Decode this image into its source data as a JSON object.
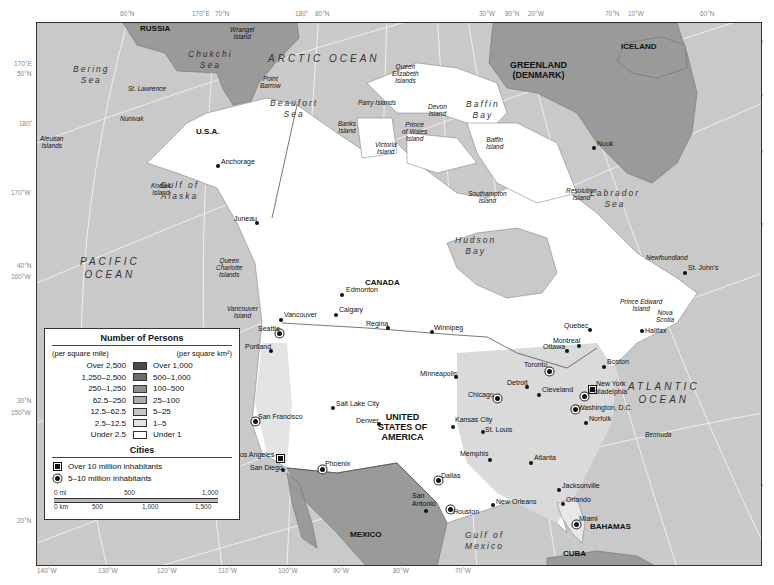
{
  "map": {
    "title": "Number of Persons",
    "frame_colors": {
      "ocean": "#c9c9c9",
      "land_foreign": "#9a9a9a",
      "land_sparse": "#ffffff",
      "land_dense": "#dadada",
      "graticule": "#f2f2f2",
      "border": "#333333"
    },
    "edge_labels": {
      "top": [
        {
          "text": "60°N",
          "x": 120,
          "y": 14
        },
        {
          "text": "170°E",
          "x": 192,
          "y": 14
        },
        {
          "text": "70°N",
          "x": 215,
          "y": 14
        },
        {
          "text": "180°",
          "x": 295,
          "y": 14
        },
        {
          "text": "80°N",
          "x": 315,
          "y": 14
        },
        {
          "text": "30°W",
          "x": 479,
          "y": 14
        },
        {
          "text": "80°N",
          "x": 505,
          "y": 14
        },
        {
          "text": "20°W",
          "x": 528,
          "y": 14
        },
        {
          "text": "70°N",
          "x": 605,
          "y": 14
        },
        {
          "text": "10°W",
          "x": 628,
          "y": 14
        },
        {
          "text": "60°N",
          "x": 700,
          "y": 14
        }
      ],
      "left": [
        {
          "text": "170°E",
          "x": 14,
          "y": 64
        },
        {
          "text": "50°N",
          "x": 17,
          "y": 74
        },
        {
          "text": "180°",
          "x": 19,
          "y": 124
        },
        {
          "text": "170°W",
          "x": 11,
          "y": 193
        },
        {
          "text": "40°N",
          "x": 17,
          "y": 266
        },
        {
          "text": "160°W",
          "x": 11,
          "y": 277
        },
        {
          "text": "30°N",
          "x": 17,
          "y": 401
        },
        {
          "text": "150°W",
          "x": 11,
          "y": 413
        },
        {
          "text": "20°N",
          "x": 17,
          "y": 521
        }
      ],
      "right": [
        {
          "text": "10°W",
          "x": 747,
          "y": 43
        },
        {
          "text": "20°W",
          "x": 747,
          "y": 97
        },
        {
          "text": "30°W",
          "x": 747,
          "y": 153
        },
        {
          "text": "50°N",
          "x": 747,
          "y": 189
        },
        {
          "text": "40°W",
          "x": 747,
          "y": 226
        },
        {
          "text": "40°N",
          "x": 747,
          "y": 317
        },
        {
          "text": "30°N",
          "x": 747,
          "y": 427
        },
        {
          "text": "60°W",
          "x": 747,
          "y": 487
        },
        {
          "text": "20°N",
          "x": 747,
          "y": 527
        }
      ],
      "bottom": [
        {
          "text": "140°W",
          "x": 37,
          "y": 571
        },
        {
          "text": "130°W",
          "x": 98,
          "y": 571
        },
        {
          "text": "120°W",
          "x": 157,
          "y": 571
        },
        {
          "text": "110°W",
          "x": 218,
          "y": 571
        },
        {
          "text": "100°W",
          "x": 278,
          "y": 571
        },
        {
          "text": "90°W",
          "x": 333,
          "y": 571
        },
        {
          "text": "80°W",
          "x": 393,
          "y": 571
        },
        {
          "text": "70°W",
          "x": 455,
          "y": 571
        }
      ]
    },
    "countries": [
      {
        "text": "RUSSIA",
        "x": 160,
        "y": 30,
        "cls": "country"
      },
      {
        "text": "U.S.A.",
        "x": 216,
        "y": 133,
        "cls": "country"
      },
      {
        "text": "CANADA",
        "x": 385,
        "y": 284,
        "cls": "country"
      },
      {
        "text": "UNITED\nSTATES OF\nAMERICA",
        "x": 398,
        "y": 417,
        "cls": "country-big"
      },
      {
        "text": "MEXICO",
        "x": 370,
        "y": 536,
        "cls": "country"
      },
      {
        "text": "GREENLAND\n(DENMARK)",
        "x": 530,
        "y": 65,
        "cls": "country-big"
      },
      {
        "text": "ICELAND",
        "x": 641,
        "y": 48,
        "cls": "country"
      },
      {
        "text": "BAHAMAS",
        "x": 610,
        "y": 528,
        "cls": "country"
      },
      {
        "text": "CUBA",
        "x": 583,
        "y": 555,
        "cls": "country"
      }
    ],
    "water_bodies": [
      {
        "text": "ARCTIC OCEAN",
        "x": 298,
        "y": 60,
        "cls": "ocean"
      },
      {
        "text": "PACIFIC\nOCEAN",
        "x": 110,
        "y": 263,
        "cls": "ocean"
      },
      {
        "text": "ATLANTIC\nOCEAN",
        "x": 658,
        "y": 388,
        "cls": "ocean"
      },
      {
        "text": "Bering\nSea",
        "x": 103,
        "y": 72,
        "cls": "sea"
      },
      {
        "text": "Chukchi\nSea",
        "x": 218,
        "y": 57,
        "cls": "sea"
      },
      {
        "text": "Beaufort\nSea",
        "x": 300,
        "y": 106,
        "cls": "sea"
      },
      {
        "text": "Baffin\nBay",
        "x": 496,
        "y": 107,
        "cls": "sea"
      },
      {
        "text": "Labrador\nSea",
        "x": 620,
        "y": 196,
        "cls": "sea"
      },
      {
        "text": "Hudson\nBay",
        "x": 485,
        "y": 243,
        "cls": "sea"
      },
      {
        "text": "Gulf of\nAlaska",
        "x": 190,
        "y": 188,
        "cls": "sea"
      },
      {
        "text": "Gulf of\nMexico",
        "x": 495,
        "y": 538,
        "cls": "sea"
      }
    ],
    "islands": [
      {
        "text": "Wrangel\nIsland",
        "x": 242,
        "y": 31
      },
      {
        "text": "St. Lawrence",
        "x": 140,
        "y": 90
      },
      {
        "text": "Point\nBarrow",
        "x": 272,
        "y": 80
      },
      {
        "text": "Nunivak",
        "x": 132,
        "y": 120
      },
      {
        "text": "Aleutian\nIslands",
        "x": 52,
        "y": 140
      },
      {
        "text": "Queen\nElizabeth\nIslands",
        "x": 404,
        "y": 68
      },
      {
        "text": "Parry Islands",
        "x": 370,
        "y": 104
      },
      {
        "text": "Banks\nIsland",
        "x": 350,
        "y": 125
      },
      {
        "text": "Devon\nIsland",
        "x": 440,
        "y": 108
      },
      {
        "text": "Prince\nof Wales\nIsland",
        "x": 414,
        "y": 126
      },
      {
        "text": "Victoria\nIsland",
        "x": 387,
        "y": 146
      },
      {
        "text": "Baffin\nIsland",
        "x": 498,
        "y": 141
      },
      {
        "text": "Southampton\nIsland",
        "x": 480,
        "y": 195
      },
      {
        "text": "Resolution\nIsland",
        "x": 578,
        "y": 192
      },
      {
        "text": "Kodiak\nIsland",
        "x": 163,
        "y": 187
      },
      {
        "text": "Queen\nCharlotte\nIslands",
        "x": 228,
        "y": 262
      },
      {
        "text": "Vancouver\nIsland",
        "x": 239,
        "y": 310
      },
      {
        "text": "Newfoundland",
        "x": 658,
        "y": 259
      },
      {
        "text": "Prince Edward\nIsland",
        "x": 632,
        "y": 303
      },
      {
        "text": "Nova\nScotia",
        "x": 668,
        "y": 314
      },
      {
        "text": "Bermuda",
        "x": 657,
        "y": 436
      }
    ],
    "cities": [
      {
        "name": "Anchorage",
        "x": 218,
        "y": 166,
        "sym": "dot",
        "lx": 221,
        "ly": 162
      },
      {
        "name": "Juneau",
        "x": 257,
        "y": 223,
        "sym": "dot",
        "lx": 234,
        "ly": 219
      },
      {
        "name": "Nuuk",
        "x": 594,
        "y": 148,
        "sym": "dot",
        "lx": 597,
        "ly": 144
      },
      {
        "name": "Edmonton",
        "x": 342,
        "y": 295,
        "sym": "dot",
        "lx": 346,
        "ly": 290
      },
      {
        "name": "Calgary",
        "x": 336,
        "y": 315,
        "sym": "dot",
        "lx": 339,
        "ly": 310
      },
      {
        "name": "Regina",
        "x": 388,
        "y": 328,
        "sym": "dot",
        "lx": 366,
        "ly": 324
      },
      {
        "name": "Winnipeg",
        "x": 432,
        "y": 332,
        "sym": "dot",
        "lx": 434,
        "ly": 328
      },
      {
        "name": "Vancouver",
        "x": 281,
        "y": 320,
        "sym": "dot",
        "lx": 284,
        "ly": 315
      },
      {
        "name": "Seattle",
        "x": 279,
        "y": 333,
        "sym": "ring",
        "lx": 258,
        "ly": 329
      },
      {
        "name": "Portland",
        "x": 271,
        "y": 351,
        "sym": "dot",
        "lx": 245,
        "ly": 347
      },
      {
        "name": "St. John's",
        "x": 685,
        "y": 273,
        "sym": "dot",
        "lx": 688,
        "ly": 268
      },
      {
        "name": "Quebec",
        "x": 590,
        "y": 330,
        "sym": "dot",
        "lx": 564,
        "ly": 326
      },
      {
        "name": "Halifax",
        "x": 642,
        "y": 331,
        "sym": "dot",
        "lx": 645,
        "ly": 331
      },
      {
        "name": "Montreal",
        "x": 579,
        "y": 346,
        "sym": "dot",
        "lx": 553,
        "ly": 341
      },
      {
        "name": "Ottawa",
        "x": 567,
        "y": 351,
        "sym": "dot",
        "lx": 543,
        "ly": 347
      },
      {
        "name": "Toronto",
        "x": 549,
        "y": 371,
        "sym": "ring",
        "lx": 524,
        "ly": 365
      },
      {
        "name": "Boston",
        "x": 604,
        "y": 367,
        "sym": "dot",
        "lx": 607,
        "ly": 362
      },
      {
        "name": "Minneapolis",
        "x": 456,
        "y": 377,
        "sym": "dot",
        "lx": 420,
        "ly": 374
      },
      {
        "name": "Detroit",
        "x": 527,
        "y": 387,
        "sym": "dot",
        "lx": 507,
        "ly": 383
      },
      {
        "name": "Chicago",
        "x": 497,
        "y": 398,
        "sym": "ring",
        "lx": 468,
        "ly": 395
      },
      {
        "name": "Cleveland",
        "x": 539,
        "y": 395,
        "sym": "dot",
        "lx": 542,
        "ly": 390
      },
      {
        "name": "New York",
        "x": 591,
        "y": 388,
        "sym": "sq",
        "lx": 596,
        "ly": 384
      },
      {
        "name": "Philadelphia",
        "x": 584,
        "y": 396,
        "sym": "ring",
        "lx": 589,
        "ly": 392
      },
      {
        "name": "Washington, D.C.",
        "x": 575,
        "y": 409,
        "sym": "ring",
        "lx": 578,
        "ly": 408
      },
      {
        "name": "Norfolk",
        "x": 586,
        "y": 423,
        "sym": "dot",
        "lx": 589,
        "ly": 419
      },
      {
        "name": "Salt Lake City",
        "x": 333,
        "y": 408,
        "sym": "dot",
        "lx": 336,
        "ly": 404
      },
      {
        "name": "San Francisco",
        "x": 255,
        "y": 421,
        "sym": "ring",
        "lx": 258,
        "ly": 417
      },
      {
        "name": "Denver",
        "x": 379,
        "y": 424,
        "sym": "dot",
        "lx": 356,
        "ly": 421
      },
      {
        "name": "Kansas City",
        "x": 453,
        "y": 427,
        "sym": "dot",
        "lx": 455,
        "ly": 420
      },
      {
        "name": "St. Louis",
        "x": 483,
        "y": 432,
        "sym": "dot",
        "lx": 485,
        "ly": 430
      },
      {
        "name": "Memphis",
        "x": 490,
        "y": 460,
        "sym": "dot",
        "lx": 460,
        "ly": 454
      },
      {
        "name": "Atlanta",
        "x": 531,
        "y": 463,
        "sym": "dot",
        "lx": 534,
        "ly": 458
      },
      {
        "name": "Los Angeles",
        "x": 279,
        "y": 457,
        "sym": "sq",
        "lx": 236,
        "ly": 455
      },
      {
        "name": "San Diego",
        "x": 283,
        "y": 470,
        "sym": "dot",
        "lx": 250,
        "ly": 468
      },
      {
        "name": "Phoenix",
        "x": 322,
        "y": 469,
        "sym": "ring",
        "lx": 325,
        "ly": 464
      },
      {
        "name": "Dallas",
        "x": 438,
        "y": 480,
        "sym": "ring",
        "lx": 441,
        "ly": 476
      },
      {
        "name": "Jacksonville",
        "x": 559,
        "y": 490,
        "sym": "dot",
        "lx": 562,
        "ly": 486
      },
      {
        "name": "Orlando",
        "x": 563,
        "y": 504,
        "sym": "dot",
        "lx": 566,
        "ly": 500
      },
      {
        "name": "San\nAntonio",
        "x": 426,
        "y": 511,
        "sym": "dot",
        "lx": 412,
        "ly": 496
      },
      {
        "name": "New Orleans",
        "x": 493,
        "y": 505,
        "sym": "dot",
        "lx": 496,
        "ly": 502
      },
      {
        "name": "Houston",
        "x": 450,
        "y": 509,
        "sym": "ring",
        "lx": 453,
        "ly": 512
      },
      {
        "name": "Miami",
        "x": 576,
        "y": 524,
        "sym": "ring",
        "lx": 579,
        "ly": 519
      }
    ]
  },
  "legend": {
    "title": "Number of Persons",
    "unit_left": "(per square mile)",
    "unit_right": "(per square km²)",
    "classes": [
      {
        "mi": "Over 2,500",
        "km": "Over 1,000",
        "color": "#4a4a4a"
      },
      {
        "mi": "1,250–2,500",
        "km": "500–1,000",
        "color": "#6d6d6d"
      },
      {
        "mi": "250–1,250",
        "km": "100–500",
        "color": "#8e8e8e"
      },
      {
        "mi": "62.5–250",
        "km": "25–100",
        "color": "#acacac"
      },
      {
        "mi": "12.5–62.5",
        "km": "5–25",
        "color": "#c6c6c6"
      },
      {
        "mi": "2.5–12.5",
        "km": "1–5",
        "color": "#e2e2e2"
      },
      {
        "mi": "Under 2.5",
        "km": "Under 1",
        "color": "#ffffff"
      }
    ],
    "cities_title": "Cities",
    "city_classes": [
      {
        "label": "Over 10 million inhabitants",
        "symbol": "square"
      },
      {
        "label": "5–10 million inhabitants",
        "symbol": "circle-dot"
      }
    ],
    "scale": {
      "mi_labels": [
        "0 mi",
        "500",
        "1,000"
      ],
      "km_labels": [
        "0 km",
        "500",
        "1,000",
        "1,500"
      ]
    }
  }
}
